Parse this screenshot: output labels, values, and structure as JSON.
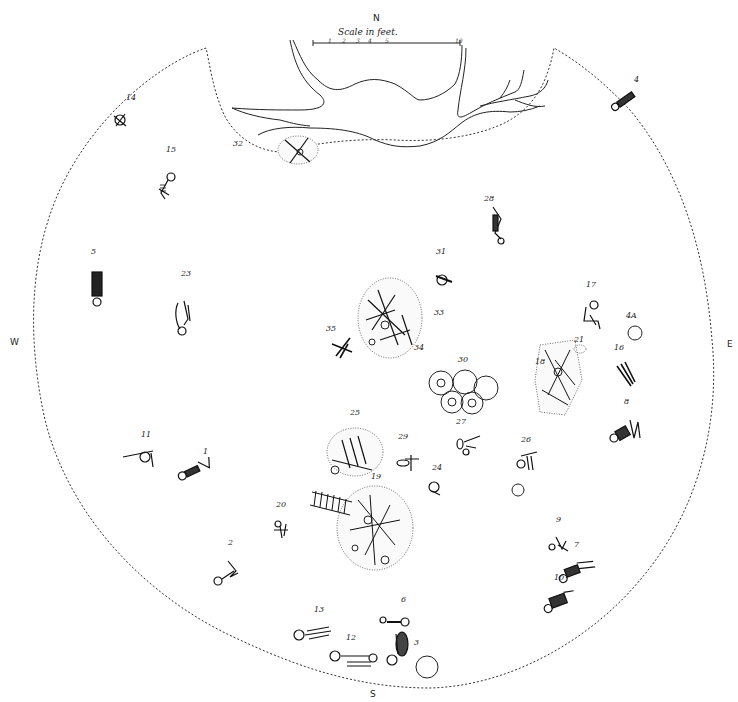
{
  "diagram": {
    "type": "archaeological burial site plan",
    "compass": {
      "north": "N",
      "south": "S",
      "east": "E",
      "west": "W"
    },
    "scale": {
      "title": "Scale in feet.",
      "ticks": [
        "1",
        "2",
        "3",
        "4",
        "5",
        "10"
      ]
    },
    "features": {
      "tree_roots": "Tree root outline at north edge",
      "boundary": "Dashed circular excavation boundary"
    },
    "burials": [
      {
        "id": "14",
        "label": "14",
        "x": 118,
        "y": 108,
        "kind": "bundle"
      },
      {
        "id": "32",
        "label": "32",
        "x": 253,
        "y": 146,
        "kind": "bone-pile"
      },
      {
        "id": "15",
        "label": "15",
        "x": 168,
        "y": 170,
        "kind": "flexed"
      },
      {
        "id": "4",
        "label": "4",
        "x": 630,
        "y": 90,
        "kind": "extended"
      },
      {
        "id": "28",
        "label": "28",
        "x": 492,
        "y": 205,
        "kind": "flexed"
      },
      {
        "id": "5",
        "label": "5",
        "x": 95,
        "y": 262,
        "kind": "extended"
      },
      {
        "id": "23",
        "label": "23",
        "x": 185,
        "y": 290,
        "kind": "flexed"
      },
      {
        "id": "31",
        "label": "31",
        "x": 440,
        "y": 262,
        "kind": "skull-bones"
      },
      {
        "id": "33",
        "label": "33",
        "x": 420,
        "y": 315,
        "kind": "ossuary"
      },
      {
        "id": "34",
        "label": "34",
        "x": 410,
        "y": 348,
        "kind": "bones"
      },
      {
        "id": "35",
        "label": "35",
        "x": 340,
        "y": 333,
        "kind": "bones"
      },
      {
        "id": "17",
        "label": "17",
        "x": 590,
        "y": 295,
        "kind": "flexed"
      },
      {
        "id": "4A",
        "label": "4A",
        "x": 630,
        "y": 326,
        "kind": "pot"
      },
      {
        "id": "21",
        "label": "21",
        "x": 578,
        "y": 346,
        "kind": "small-pile"
      },
      {
        "id": "16",
        "label": "16",
        "x": 620,
        "y": 358,
        "kind": "bones"
      },
      {
        "id": "18",
        "label": "18",
        "x": 545,
        "y": 368,
        "kind": "ossuary"
      },
      {
        "id": "30",
        "label": "30",
        "x": 462,
        "y": 370,
        "kind": "pot-cluster"
      },
      {
        "id": "8",
        "label": "8",
        "x": 628,
        "y": 412,
        "kind": "extended"
      },
      {
        "id": "27",
        "label": "27",
        "x": 466,
        "y": 430,
        "kind": "skull-bones"
      },
      {
        "id": "26",
        "label": "26",
        "x": 525,
        "y": 448,
        "kind": "bones"
      },
      {
        "id": "25",
        "label": "25",
        "x": 360,
        "y": 423,
        "kind": "ossuary"
      },
      {
        "id": "29",
        "label": "29",
        "x": 404,
        "y": 447,
        "kind": "bones"
      },
      {
        "id": "24",
        "label": "24",
        "x": 436,
        "y": 478,
        "kind": "skull"
      },
      {
        "id": "11",
        "label": "11",
        "x": 145,
        "y": 445,
        "kind": "skull-bones"
      },
      {
        "id": "1",
        "label": "1",
        "x": 205,
        "y": 462,
        "kind": "extended"
      },
      {
        "id": "19",
        "label": "19",
        "x": 375,
        "y": 485,
        "kind": "ossuary"
      },
      {
        "id": "20",
        "label": "20",
        "x": 280,
        "y": 513,
        "kind": "bones"
      },
      {
        "id": "9",
        "label": "9",
        "x": 560,
        "y": 530,
        "kind": "flexed"
      },
      {
        "id": "2",
        "label": "2",
        "x": 232,
        "y": 555,
        "kind": "flexed"
      },
      {
        "id": "7",
        "label": "7",
        "x": 578,
        "y": 555,
        "kind": "extended"
      },
      {
        "id": "10",
        "label": "10",
        "x": 560,
        "y": 588,
        "kind": "extended"
      },
      {
        "id": "13",
        "label": "13",
        "x": 318,
        "y": 620,
        "kind": "extended"
      },
      {
        "id": "6",
        "label": "6",
        "x": 393,
        "y": 610,
        "kind": "extended"
      },
      {
        "id": "12",
        "label": "12",
        "x": 350,
        "y": 648,
        "kind": "extended"
      },
      {
        "id": "3",
        "label": "3",
        "x": 400,
        "y": 645,
        "kind": "flexed"
      }
    ],
    "isolated_objects": [
      {
        "kind": "pot",
        "x": 518,
        "y": 490
      },
      {
        "kind": "pot",
        "x": 426,
        "y": 667
      }
    ]
  }
}
